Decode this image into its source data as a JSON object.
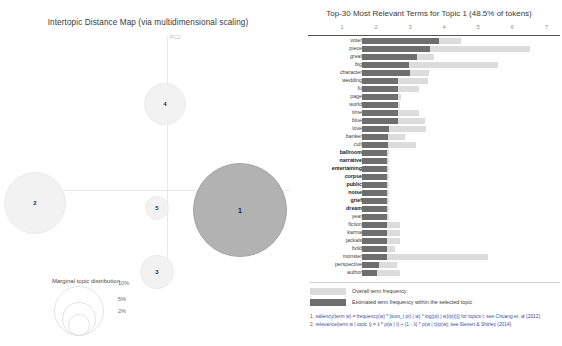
{
  "map": {
    "title": "Intertopic Distance Map (via multidimensional scaling)",
    "axis_labels": {
      "x": "PC1",
      "y": "PC2"
    },
    "topics": [
      {
        "id": "1",
        "label": "1",
        "cx": 240,
        "cy": 180,
        "r": 47,
        "selected": true
      },
      {
        "id": "2",
        "label": "2",
        "cx": 35,
        "cy": 173,
        "r": 31,
        "selected": false
      },
      {
        "id": "3",
        "label": "3",
        "cx": 157,
        "cy": 242,
        "r": 17,
        "selected": false
      },
      {
        "id": "4",
        "label": "4",
        "cx": 165,
        "cy": 74,
        "r": 21,
        "selected": false
      },
      {
        "id": "5",
        "label": "5",
        "cx": 157,
        "cy": 178,
        "r": 12,
        "selected": false
      }
    ],
    "marginal": {
      "title": "Marginal topic distribution",
      "sizes": [
        "2%",
        "5%",
        "10%"
      ]
    }
  },
  "bars": {
    "title": "Top-30 Most Relevant Terms for Topic 1 (48.5% of tokens)",
    "axis_ticks": [
      "1",
      "2",
      "3",
      "4",
      "5",
      "6",
      "7"
    ],
    "axis_max": 7.4,
    "legend": {
      "overall_label": "Overall term frequency",
      "topic_label": "Estimated term frequency within the selected topic",
      "formula1_num": "1.",
      "formula1": "saliency(term w) = frequency(w) * [sum_t p(t | w) * log(p(t | w)/p(t))] for topics t; see Chuang et. al (2012)",
      "formula2_num": "2.",
      "formula2": "relevance(term w | topic t) = λ * p(w | t) + (1 - λ) * p(w | t)/p(w); see Sievert & Shirley (2014)"
    },
    "terms": [
      {
        "term": "voter",
        "topic": 3.05,
        "overall": 3.95,
        "highlight": false
      },
      {
        "term": "piece",
        "topic": 2.7,
        "overall": 6.7,
        "highlight": false
      },
      {
        "term": "great",
        "topic": 2.2,
        "overall": 2.88,
        "highlight": false
      },
      {
        "term": "big",
        "topic": 1.88,
        "overall": 5.4,
        "highlight": false
      },
      {
        "term": "character",
        "topic": 1.9,
        "overall": 2.66,
        "highlight": false
      },
      {
        "term": "wedding",
        "topic": 1.42,
        "overall": 2.62,
        "highlight": false
      },
      {
        "term": "fu",
        "topic": 1.42,
        "overall": 2.28,
        "highlight": false
      },
      {
        "term": "page",
        "topic": 1.42,
        "overall": 1.54,
        "highlight": false
      },
      {
        "term": "world",
        "topic": 1.42,
        "overall": 1.5,
        "highlight": false
      },
      {
        "term": "time",
        "topic": 1.42,
        "overall": 2.26,
        "highlight": false
      },
      {
        "term": "blue",
        "topic": 1.42,
        "overall": 2.52,
        "highlight": false
      },
      {
        "term": "love",
        "topic": 1.08,
        "overall": 2.54,
        "highlight": false
      },
      {
        "term": "banker",
        "topic": 1.02,
        "overall": 1.72,
        "highlight": false
      },
      {
        "term": "cult",
        "topic": 1.02,
        "overall": 2.16,
        "highlight": false
      },
      {
        "term": "ballroom",
        "topic": 1.0,
        "overall": 1.06,
        "highlight": true
      },
      {
        "term": "narrative",
        "topic": 1.0,
        "overall": 1.06,
        "highlight": true
      },
      {
        "term": "entertaining",
        "topic": 1.0,
        "overall": 1.06,
        "highlight": true
      },
      {
        "term": "corpse",
        "topic": 1.0,
        "overall": 1.06,
        "highlight": true
      },
      {
        "term": "public",
        "topic": 1.0,
        "overall": 1.06,
        "highlight": true
      },
      {
        "term": "noise",
        "topic": 1.0,
        "overall": 1.06,
        "highlight": true
      },
      {
        "term": "grief",
        "topic": 1.0,
        "overall": 1.06,
        "highlight": true
      },
      {
        "term": "dream",
        "topic": 1.0,
        "overall": 1.06,
        "highlight": true
      },
      {
        "term": "year",
        "topic": 1.0,
        "overall": 1.06,
        "highlight": false
      },
      {
        "term": "fiction",
        "topic": 1.0,
        "overall": 1.52,
        "highlight": false
      },
      {
        "term": "karma",
        "topic": 1.0,
        "overall": 1.52,
        "highlight": false
      },
      {
        "term": "jackals",
        "topic": 1.0,
        "overall": 1.5,
        "highlight": false
      },
      {
        "term": "bold",
        "topic": 1.0,
        "overall": 1.3,
        "highlight": false
      },
      {
        "term": "monster",
        "topic": 1.0,
        "overall": 5.0,
        "highlight": false
      },
      {
        "term": "perspective",
        "topic": 0.66,
        "overall": 1.4,
        "highlight": false
      },
      {
        "term": "author",
        "topic": 0.58,
        "overall": 1.52,
        "highlight": false
      }
    ]
  },
  "chart_data": {
    "type": "bar",
    "title": "Top-30 Most Relevant Terms for Topic 1 (48.5% of tokens)",
    "orientation": "horizontal",
    "xlabel": "",
    "ylabel": "",
    "xlim": [
      0,
      7.4
    ],
    "grid": false,
    "legend_position": "bottom-left",
    "categories": [
      "voter",
      "piece",
      "great",
      "big",
      "character",
      "wedding",
      "fu",
      "page",
      "world",
      "time",
      "blue",
      "love",
      "banker",
      "cult",
      "ballroom",
      "narrative",
      "entertaining",
      "corpse",
      "public",
      "noise",
      "grief",
      "dream",
      "year",
      "fiction",
      "karma",
      "jackals",
      "bold",
      "monster",
      "perspective",
      "author"
    ],
    "series": [
      {
        "name": "Overall term frequency",
        "color": "#dcdcdc",
        "values": [
          3.95,
          6.7,
          2.88,
          5.4,
          2.66,
          2.62,
          2.28,
          1.54,
          1.5,
          2.26,
          2.52,
          2.54,
          1.72,
          2.16,
          1.06,
          1.06,
          1.06,
          1.06,
          1.06,
          1.06,
          1.06,
          1.06,
          1.06,
          1.52,
          1.52,
          1.5,
          1.3,
          5.0,
          1.4,
          1.52
        ]
      },
      {
        "name": "Estimated term frequency within the selected topic",
        "color": "#6e6e6e",
        "values": [
          3.05,
          2.7,
          2.2,
          1.88,
          1.9,
          1.42,
          1.42,
          1.42,
          1.42,
          1.42,
          1.42,
          1.08,
          1.02,
          1.02,
          1.0,
          1.0,
          1.0,
          1.0,
          1.0,
          1.0,
          1.0,
          1.0,
          1.0,
          1.0,
          1.0,
          1.0,
          1.0,
          1.0,
          0.66,
          0.58
        ]
      }
    ],
    "secondary_chart": {
      "type": "scatter",
      "title": "Intertopic Distance Map (via multidimensional scaling)",
      "xlabel": "PC1",
      "ylabel": "PC2",
      "points": [
        {
          "label": "1",
          "x": 0.26,
          "y": -0.04,
          "size": 48.5
        },
        {
          "label": "2",
          "x": -0.45,
          "y": -0.02,
          "size": 21.0
        },
        {
          "label": "3",
          "x": -0.03,
          "y": -0.34,
          "size": 7.0
        },
        {
          "label": "4",
          "x": -0.01,
          "y": 0.36,
          "size": 10.0
        },
        {
          "label": "5",
          "x": -0.03,
          "y": -0.07,
          "size": 4.0
        }
      ]
    }
  }
}
